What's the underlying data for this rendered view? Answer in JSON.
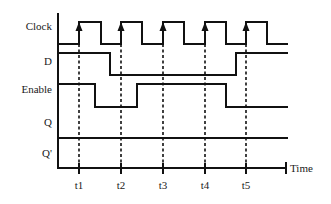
{
  "diagram": {
    "type": "timing-diagram",
    "signals": [
      {
        "id": "clock",
        "label": "Clock",
        "label_y": 30
      },
      {
        "id": "d",
        "label": "D",
        "label_y": 65
      },
      {
        "id": "enable",
        "label": "Enable",
        "label_y": 93
      },
      {
        "id": "q",
        "label": "Q",
        "label_y": 126
      },
      {
        "id": "qbar",
        "label": "Q'",
        "label_y": 157
      }
    ],
    "time_axis": {
      "label": "Time",
      "ticks": [
        {
          "label": "t1",
          "x": 79
        },
        {
          "label": "t2",
          "x": 121
        },
        {
          "label": "t3",
          "x": 163
        },
        {
          "label": "t4",
          "x": 205
        },
        {
          "label": "t5",
          "x": 246
        }
      ]
    },
    "waveforms": {
      "clock": "M58,44 L79,44 L79,22 L101,22 L101,44 L121,44 L121,22 L142,22 L142,44 L163,44 L163,22 L184,22 L184,44 L205,44 L205,22 L226,22 L226,44 L246,44 L246,22 L267,22 L267,44 L288,44",
      "d": "M58,53 L110,53 L110,75 L236,75 L236,53 L288,53",
      "enable": "M58,84 L95,84 L95,107 L137,107 L137,84 L226,84 L226,107 L288,107",
      "q": "M58,138 L288,138",
      "qbar": "M58,168 L286,168"
    },
    "colors": {
      "line": "#111111",
      "background": "#ffffff"
    }
  }
}
